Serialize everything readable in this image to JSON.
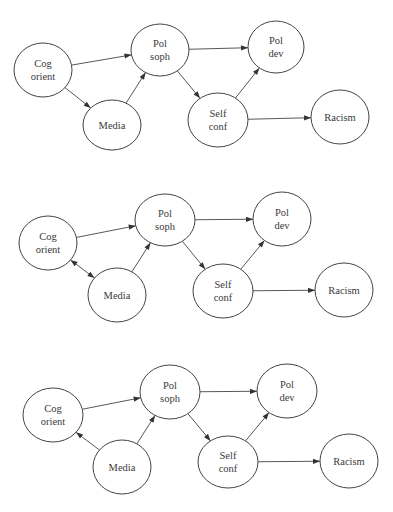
{
  "colors": {
    "background": "#ffffff",
    "stroke": "#444444",
    "text": "#3a3a3a",
    "arrowhead": "#333333"
  },
  "node_labels": {
    "cog_orient": [
      "Cog",
      "orient"
    ],
    "pol_soph": [
      "Pol",
      "soph"
    ],
    "pol_dev": [
      "Pol",
      "dev"
    ],
    "media": [
      "Media"
    ],
    "self_conf": [
      "Self",
      "conf"
    ],
    "racism": [
      "Racism"
    ]
  },
  "diagrams": [
    {
      "id": "model-1",
      "nodes": [
        {
          "id": "cog_orient",
          "cx": 43,
          "cy": 70,
          "rx": 29,
          "ry": 27
        },
        {
          "id": "pol_soph",
          "cx": 160,
          "cy": 50,
          "rx": 29,
          "ry": 26
        },
        {
          "id": "pol_dev",
          "cx": 276,
          "cy": 47,
          "rx": 28,
          "ry": 26
        },
        {
          "id": "media",
          "cx": 112,
          "cy": 125,
          "rx": 29,
          "ry": 25
        },
        {
          "id": "self_conf",
          "cx": 218,
          "cy": 120,
          "rx": 30,
          "ry": 27
        },
        {
          "id": "racism",
          "cx": 340,
          "cy": 117,
          "rx": 29,
          "ry": 27
        }
      ],
      "edges": [
        {
          "from": "cog_orient",
          "to": "pol_soph",
          "type": "directed"
        },
        {
          "from": "cog_orient",
          "to": "media",
          "type": "directed"
        },
        {
          "from": "media",
          "to": "pol_soph",
          "type": "directed"
        },
        {
          "from": "pol_soph",
          "to": "pol_dev",
          "type": "directed"
        },
        {
          "from": "pol_soph",
          "to": "self_conf",
          "type": "directed"
        },
        {
          "from": "self_conf",
          "to": "pol_dev",
          "type": "directed"
        },
        {
          "from": "self_conf",
          "to": "racism",
          "type": "directed"
        }
      ]
    },
    {
      "id": "model-2",
      "nodes": [
        {
          "id": "cog_orient",
          "cx": 48,
          "cy": 243,
          "rx": 29,
          "ry": 27
        },
        {
          "id": "pol_soph",
          "cx": 165,
          "cy": 220,
          "rx": 30,
          "ry": 26
        },
        {
          "id": "pol_dev",
          "cx": 282,
          "cy": 219,
          "rx": 29,
          "ry": 27
        },
        {
          "id": "media",
          "cx": 117,
          "cy": 295,
          "rx": 29,
          "ry": 27
        },
        {
          "id": "self_conf",
          "cx": 223,
          "cy": 291,
          "rx": 30,
          "ry": 27
        },
        {
          "id": "racism",
          "cx": 344,
          "cy": 290,
          "rx": 29,
          "ry": 27
        }
      ],
      "edges": [
        {
          "from": "cog_orient",
          "to": "pol_soph",
          "type": "directed"
        },
        {
          "from": "cog_orient",
          "to": "media",
          "type": "bidirectional"
        },
        {
          "from": "media",
          "to": "pol_soph",
          "type": "directed"
        },
        {
          "from": "pol_soph",
          "to": "pol_dev",
          "type": "directed"
        },
        {
          "from": "pol_soph",
          "to": "self_conf",
          "type": "directed"
        },
        {
          "from": "self_conf",
          "to": "pol_dev",
          "type": "directed"
        },
        {
          "from": "self_conf",
          "to": "racism",
          "type": "directed"
        }
      ]
    },
    {
      "id": "model-3",
      "nodes": [
        {
          "id": "cog_orient",
          "cx": 53,
          "cy": 415,
          "rx": 30,
          "ry": 27
        },
        {
          "id": "pol_soph",
          "cx": 170,
          "cy": 392,
          "rx": 30,
          "ry": 27
        },
        {
          "id": "pol_dev",
          "cx": 287,
          "cy": 391,
          "rx": 30,
          "ry": 27
        },
        {
          "id": "media",
          "cx": 122,
          "cy": 467,
          "rx": 29,
          "ry": 27
        },
        {
          "id": "self_conf",
          "cx": 228,
          "cy": 462,
          "rx": 30,
          "ry": 26
        },
        {
          "id": "racism",
          "cx": 349,
          "cy": 461,
          "rx": 29,
          "ry": 27
        }
      ],
      "edges": [
        {
          "from": "cog_orient",
          "to": "pol_soph",
          "type": "directed"
        },
        {
          "from": "media",
          "to": "cog_orient",
          "type": "directed"
        },
        {
          "from": "media",
          "to": "pol_soph",
          "type": "directed"
        },
        {
          "from": "pol_soph",
          "to": "pol_dev",
          "type": "directed"
        },
        {
          "from": "pol_soph",
          "to": "self_conf",
          "type": "directed"
        },
        {
          "from": "self_conf",
          "to": "pol_dev",
          "type": "directed"
        },
        {
          "from": "self_conf",
          "to": "racism",
          "type": "directed"
        }
      ]
    }
  ]
}
